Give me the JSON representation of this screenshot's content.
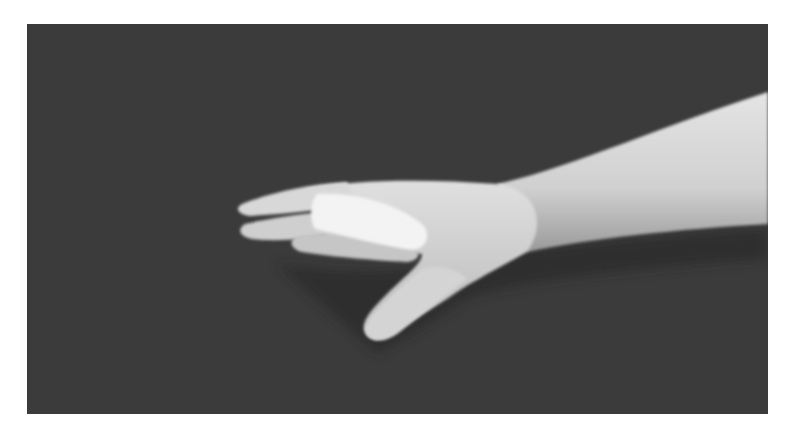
{
  "image": {
    "alt": "Grayscale photograph of a hand and forearm extended horizontally against a dark background, with a white splint on the index finger",
    "background_color": "#3b3b3b",
    "skin_color": "#d6d6d6",
    "splint_color": "#f2f2f2",
    "border_color": "#ffffff"
  }
}
